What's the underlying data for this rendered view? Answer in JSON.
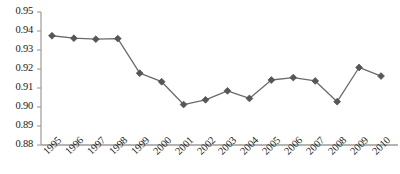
{
  "chart_data": {
    "type": "line",
    "title": "",
    "subtitle": "",
    "xlabel": "",
    "ylabel": "",
    "categories": [
      "1995",
      "1996",
      "1997",
      "1998",
      "1999",
      "2000",
      "2001",
      "2002",
      "2003",
      "2004",
      "2005",
      "2006",
      "2007",
      "2008",
      "2009",
      "2010"
    ],
    "values": [
      0.9375,
      0.9362,
      0.9357,
      0.936,
      0.9178,
      0.9133,
      0.9013,
      0.9038,
      0.9085,
      0.9045,
      0.9142,
      0.9155,
      0.9137,
      0.9028,
      0.9208,
      0.9163
    ],
    "series": [
      {
        "name": "series-1",
        "values": [
          0.9375,
          0.9362,
          0.9357,
          0.936,
          0.9178,
          0.9133,
          0.9013,
          0.9038,
          0.9085,
          0.9045,
          0.9142,
          0.9155,
          0.9137,
          0.9028,
          0.9208,
          0.9163
        ]
      }
    ],
    "ylim": [
      0.88,
      0.95
    ],
    "yticks": [
      0.88,
      0.89,
      0.9,
      0.91,
      0.92,
      0.93,
      0.94,
      0.95
    ],
    "ytick_labels": [
      "0.88",
      "0.89",
      "0.90",
      "0.91",
      "0.92",
      "0.93",
      "0.94",
      "0.95"
    ],
    "xtick_labels": [
      "1995",
      "1996",
      "1997",
      "1998",
      "1999",
      "2000",
      "2001",
      "2002",
      "2003",
      "2004",
      "2005",
      "2006",
      "2007",
      "2008",
      "2009",
      "2010"
    ],
    "grid": false,
    "legend": false,
    "legend_position": "none",
    "marker": "diamond",
    "xlabel_rotation": -45,
    "colors": {
      "line": "#6b6b6b",
      "marker": "#565656",
      "axis": "#9b9b9b",
      "tick_text": "#1a1a1a",
      "background": "#ffffff"
    }
  }
}
